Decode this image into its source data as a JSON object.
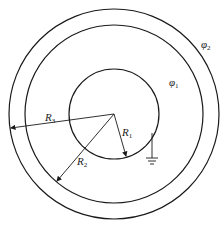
{
  "diagram": {
    "type": "concentric-spheres-cross-section",
    "stroke_color": "#1a1a1a",
    "background": "#ffffff",
    "center": [
      114,
      114
    ],
    "circles": [
      {
        "name": "inner-sphere",
        "radius": 45
      },
      {
        "name": "middle-shell-inner-surface",
        "radius": 90
      },
      {
        "name": "outer-shell-outer-surface",
        "radius": 105
      }
    ],
    "radius_arrows": [
      {
        "label": "R",
        "sub": "1",
        "to": [
          125,
          156
        ]
      },
      {
        "label": "R",
        "sub": "2",
        "to": [
          57,
          181
        ]
      },
      {
        "label": "R",
        "sub": "3",
        "to": [
          11,
          128
        ]
      }
    ],
    "potential_labels": [
      {
        "label": "φ",
        "sub": "1",
        "pos": [
          170,
          86
        ]
      },
      {
        "label": "φ",
        "sub": "2",
        "pos": [
          202,
          48
        ]
      }
    ],
    "ground": {
      "label": "ground-symbol",
      "attach": [
        152,
        133
      ],
      "base_y": 160
    }
  }
}
